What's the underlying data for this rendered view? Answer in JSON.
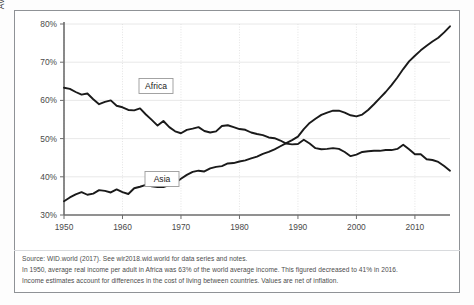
{
  "figure": {
    "frame_color": "#8f9296",
    "background": "#ffffff"
  },
  "axis": {
    "y_label_line1": "Average national income as a percentage",
    "y_label_line2": "of average global income (%)",
    "y_ticks": [
      "80%",
      "70%",
      "60%",
      "50%",
      "40%",
      "30%"
    ],
    "x_ticks": [
      "1950",
      "1960",
      "1970",
      "1980",
      "1990",
      "2000",
      "2010"
    ]
  },
  "series_labels": {
    "africa": "Africa",
    "asia": "Asia"
  },
  "notes": {
    "line1": "Source: WID.world (2017). See wir2018.wid.world for data series and notes.",
    "line2": "In 1950, average real income per adult in Africa was 63% of the world average income. This figured decreased to 41% in 2016.",
    "line3": "Income estimates account for differences in the cost of living between countries. Values are net of inflation."
  },
  "chart_data": {
    "type": "line",
    "title": "",
    "xlabel": "",
    "ylabel": "Average national income as a percentage of average global income (%)",
    "xlim": [
      1950,
      2016
    ],
    "ylim": [
      30,
      80
    ],
    "ytick_values": [
      30,
      40,
      50,
      60,
      70,
      80
    ],
    "xtick_values": [
      1950,
      1960,
      1970,
      1980,
      1990,
      2000,
      2010
    ],
    "grid": true,
    "legend": "inline-labels",
    "line_color": "#1a1a1a",
    "x": [
      1950,
      1951,
      1952,
      1953,
      1954,
      1955,
      1956,
      1957,
      1958,
      1959,
      1960,
      1961,
      1962,
      1963,
      1964,
      1965,
      1966,
      1967,
      1968,
      1969,
      1970,
      1971,
      1972,
      1973,
      1974,
      1975,
      1976,
      1977,
      1978,
      1979,
      1980,
      1981,
      1982,
      1983,
      1984,
      1985,
      1986,
      1987,
      1988,
      1989,
      1990,
      1991,
      1992,
      1993,
      1994,
      1995,
      1996,
      1997,
      1998,
      1999,
      2000,
      2001,
      2002,
      2003,
      2004,
      2005,
      2006,
      2007,
      2008,
      2009,
      2010,
      2011,
      2012,
      2013,
      2014,
      2015,
      2016
    ],
    "series": [
      {
        "name": "Africa",
        "values": [
          63.3,
          63.0,
          62.2,
          61.5,
          61.8,
          60.3,
          59.0,
          59.6,
          60.0,
          58.6,
          58.2,
          57.5,
          57.4,
          57.9,
          56.3,
          54.9,
          53.4,
          54.6,
          53.0,
          51.9,
          51.4,
          52.3,
          52.6,
          53.0,
          52.0,
          51.6,
          51.9,
          53.3,
          53.5,
          53.0,
          52.5,
          52.3,
          51.6,
          51.2,
          50.9,
          50.3,
          50.1,
          49.5,
          48.7,
          48.5,
          48.6,
          49.7,
          48.7,
          47.5,
          47.2,
          47.3,
          47.5,
          47.3,
          46.5,
          45.4,
          45.8,
          46.5,
          46.7,
          46.8,
          46.8,
          47.0,
          47.0,
          47.3,
          48.4,
          47.2,
          45.9,
          45.9,
          44.6,
          44.4,
          43.9,
          42.8,
          41.6
        ]
      },
      {
        "name": "Asia",
        "values": [
          33.6,
          34.6,
          35.4,
          36.0,
          35.3,
          35.6,
          36.5,
          36.3,
          35.9,
          36.7,
          36.0,
          35.5,
          37.0,
          37.4,
          37.9,
          37.5,
          37.3,
          37.3,
          37.8,
          38.4,
          39.5,
          40.5,
          41.3,
          41.6,
          41.4,
          42.2,
          42.6,
          42.8,
          43.5,
          43.6,
          44.0,
          44.3,
          44.8,
          45.3,
          46.0,
          46.5,
          47.2,
          48.0,
          48.8,
          49.6,
          50.5,
          52.5,
          54.1,
          55.2,
          56.2,
          56.8,
          57.3,
          57.3,
          56.8,
          56.1,
          55.8,
          56.3,
          57.5,
          59.0,
          60.6,
          62.2,
          64.0,
          66.0,
          68.2,
          70.2,
          71.7,
          73.1,
          74.3,
          75.4,
          76.4,
          77.8,
          79.4
        ]
      }
    ]
  }
}
